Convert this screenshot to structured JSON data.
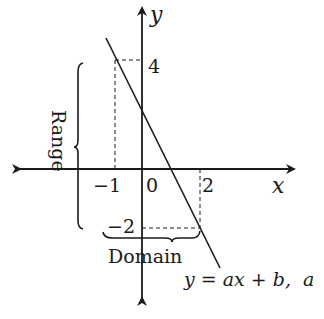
{
  "axes": {
    "x_label": "x",
    "y_label": "y"
  },
  "ticks": {
    "x_neg1": "−1",
    "x_zero": "0",
    "x_two": "2",
    "y_four": "4",
    "y_neg2": "−2"
  },
  "annotations": {
    "range": "Range",
    "domain": "Domain",
    "equation": "y = ax + b,  a"
  },
  "line": {
    "description": "Decreasing line segment from (-1, 4) to (2, -2)",
    "endpoints": [
      [
        -1,
        4
      ],
      [
        2,
        -2
      ]
    ]
  },
  "colors": {
    "stroke": "#1a1a1a",
    "background": "#ffffff"
  }
}
